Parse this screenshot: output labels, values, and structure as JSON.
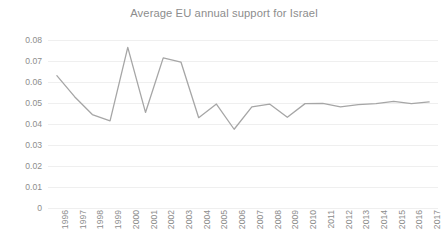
{
  "chart_data": {
    "type": "line",
    "title": "Average EU annual support for Israel",
    "xlabel": "",
    "ylabel": "",
    "ylim": [
      0,
      0.08
    ],
    "yticks": [
      "0",
      "0.01",
      "0.02",
      "0.03",
      "0.04",
      "0.05",
      "0.06",
      "0.07",
      "0.08"
    ],
    "ytick_values": [
      0,
      0.01,
      0.02,
      0.03,
      0.04,
      0.05,
      0.06,
      0.07,
      0.08
    ],
    "grid": true,
    "legend": "none",
    "line_color": "#a6a6a6",
    "grid_color": "#efefef",
    "text_color": "#8d8d8d",
    "categories": [
      "1996",
      "1997",
      "1998",
      "1999",
      "2000",
      "2001",
      "2002",
      "2003",
      "2004",
      "2005",
      "2006",
      "2007",
      "2008",
      "2009",
      "2010",
      "2011",
      "2012",
      "2013",
      "2014",
      "2015",
      "2016",
      "2017"
    ],
    "series": [
      {
        "name": "Average EU annual support for Israel",
        "values": [
          0.063,
          0.053,
          0.0445,
          0.0415,
          0.0765,
          0.0455,
          0.0715,
          0.0695,
          0.043,
          0.0495,
          0.0375,
          0.0482,
          0.0495,
          0.0432,
          0.0497,
          0.0498,
          0.0482,
          0.0492,
          0.0497,
          0.0508,
          0.0497,
          0.0505
        ]
      }
    ]
  }
}
